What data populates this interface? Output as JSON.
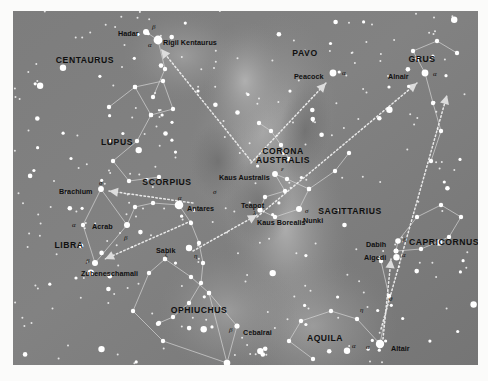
{
  "figure": {
    "kind": "star-chart",
    "frame": {
      "x": 13,
      "y": 11,
      "width": 465,
      "height": 354
    },
    "colors": {
      "sky_base": "#7b7b7b",
      "sky_light": "#9a9a9a",
      "milky_way": "#a8a8a8",
      "star": "#ffffff",
      "line": "#cfcfcf",
      "pointer": "#e6e6e6",
      "label": "#0f0f0f",
      "page": "#fbfbfa"
    }
  },
  "chart_data": {
    "type": "scatter",
    "xlabel": "",
    "ylabel": "",
    "constellations": [
      {
        "name": "CENTAURUS",
        "x": 72,
        "y": 45,
        "two_line": false
      },
      {
        "name": "LUPUS",
        "x": 104,
        "y": 127,
        "two_line": false
      },
      {
        "name": "SCORPIUS",
        "x": 154,
        "y": 167,
        "two_line": false
      },
      {
        "name": "LIBRA",
        "x": 56,
        "y": 230,
        "two_line": false
      },
      {
        "name": "OPHIUCHUS",
        "x": 186,
        "y": 295,
        "two_line": false
      },
      {
        "name": "CORONA AUSTRALIS",
        "x": 270,
        "y": 136,
        "two_line": true,
        "line1": "CORONA",
        "line2": "AUSTRALIS"
      },
      {
        "name": "SAGITTARIUS",
        "x": 337,
        "y": 196,
        "two_line": false
      },
      {
        "name": "PAVO",
        "x": 292,
        "y": 38,
        "two_line": false
      },
      {
        "name": "GRUS",
        "x": 409,
        "y": 44,
        "two_line": false
      },
      {
        "name": "CAPRICORNUS",
        "x": 431,
        "y": 227,
        "two_line": false
      },
      {
        "name": "AQUILA",
        "x": 312,
        "y": 323,
        "two_line": false
      }
    ],
    "named_stars": [
      {
        "name": "Hadar",
        "greek": "β",
        "label_x": 105,
        "label_y": 19,
        "greek_x": 139,
        "greek_y": 13,
        "sx": 133,
        "sy": 21,
        "r": 3.0
      },
      {
        "name": "Rigil Kentaurus",
        "greek": "α",
        "label_x": 150,
        "label_y": 28,
        "greek_x": 135,
        "greek_y": 31,
        "sx": 145,
        "sy": 29,
        "r": 4.4
      },
      {
        "name": "Brachium",
        "greek": "σ",
        "label_x": 46,
        "label_y": 177,
        "greek_x": 86,
        "greek_y": 169,
        "sx": 88,
        "sy": 178,
        "r": 2.9
      },
      {
        "name": "Antares",
        "greek": "α",
        "label_x": 174,
        "label_y": 194,
        "greek_x": 165,
        "greek_y": 184,
        "sx": 166,
        "sy": 194,
        "r": 4.3
      },
      {
        "name": "Acrab",
        "greek": "β",
        "label_x": 79,
        "label_y": 212,
        "greek_x": 111,
        "greek_y": 224,
        "sx": 114,
        "sy": 214,
        "r": 3.0
      },
      {
        "name": "Zubeneschamali",
        "greek": "β",
        "label_x": 68,
        "label_y": 259,
        "greek_x": 73,
        "greek_y": 247,
        "sx": 82,
        "sy": 252,
        "r": 3.0
      },
      {
        "name": "Sabik",
        "greek": "η",
        "label_x": 143,
        "label_y": 236,
        "greek_x": 181,
        "greek_y": 242,
        "sx": 176,
        "sy": 237,
        "r": 3.2
      },
      {
        "name": "Cebalrai",
        "greek": "β",
        "label_x": 230,
        "label_y": 318,
        "greek_x": 216,
        "greek_y": 316,
        "sx": 224,
        "sy": 315,
        "r": 2.6
      },
      {
        "name": "Rasalhague",
        "greek": "α",
        "label_x": 221,
        "label_y": 353,
        "greek_x": 205,
        "greek_y": 352,
        "sx": 214,
        "sy": 352,
        "r": 3.3
      },
      {
        "name": "Kaus Australis",
        "greek": "ε",
        "label_x": 206,
        "label_y": 163,
        "greek_x": 268,
        "greek_y": 155,
        "sx": 262,
        "sy": 163,
        "r": 2.9
      },
      {
        "name": "Teapot",
        "greek": "",
        "label_x": 228,
        "label_y": 191,
        "greek_x": 0,
        "greek_y": 0,
        "sx": 0,
        "sy": 0,
        "r": 0
      },
      {
        "name": "Kaus Borealis",
        "greek": "λ",
        "label_x": 244,
        "label_y": 208,
        "greek_x": 240,
        "greek_y": 199,
        "sx": 247,
        "sy": 199,
        "r": 2.6
      },
      {
        "name": "Nunki",
        "greek": "σ",
        "label_x": 290,
        "label_y": 206,
        "greek_x": 292,
        "greek_y": 197,
        "sx": 286,
        "sy": 198,
        "r": 3.0
      },
      {
        "name": "Peacock",
        "greek": "α",
        "label_x": 281,
        "label_y": 62,
        "greek_x": 329,
        "greek_y": 59,
        "sx": 320,
        "sy": 62,
        "r": 3.4
      },
      {
        "name": "Alnair",
        "greek": "α",
        "label_x": 375,
        "label_y": 62,
        "greek_x": 420,
        "greek_y": 60,
        "sx": 412,
        "sy": 62,
        "r": 3.4
      },
      {
        "name": "Dabih",
        "greek": "β",
        "label_x": 353,
        "label_y": 230,
        "greek_x": 390,
        "greek_y": 226,
        "sx": 385,
        "sy": 230,
        "r": 2.8
      },
      {
        "name": "Algedi",
        "greek": "α",
        "label_x": 351,
        "label_y": 243,
        "greek_x": 389,
        "greek_y": 241,
        "sx": 383,
        "sy": 240,
        "r": 2.5
      },
      {
        "name": "Altair",
        "greek": "α",
        "label_x": 378,
        "label_y": 334,
        "greek_x": 353,
        "greek_y": 333,
        "sx": 367,
        "sy": 333,
        "r": 4.2
      }
    ],
    "greek_only_labels": [
      {
        "glyph": "α",
        "x": 59,
        "y": 211
      },
      {
        "glyph": "σ",
        "x": 200,
        "y": 178
      },
      {
        "glyph": "ζ",
        "x": 152,
        "y": 240
      },
      {
        "glyph": "η",
        "x": 347,
        "y": 296
      },
      {
        "glyph": "θ",
        "x": 376,
        "y": 285
      },
      {
        "glyph": "α",
        "x": 339,
        "y": 332
      }
    ],
    "pointer_arrows": [
      {
        "from_x": 238,
        "from_y": 150,
        "to_x": 148,
        "to_y": 38,
        "note": "to Rigil Kentaurus"
      },
      {
        "from_x": 238,
        "from_y": 152,
        "to_x": 313,
        "to_y": 72,
        "note": "to Peacock"
      },
      {
        "from_x": 244,
        "from_y": 206,
        "to_x": 404,
        "to_y": 72,
        "note": "to Alnair"
      },
      {
        "from_x": 368,
        "from_y": 318,
        "to_x": 434,
        "to_y": 84,
        "note": "to Grus tail"
      },
      {
        "from_x": 180,
        "from_y": 192,
        "to_x": 96,
        "to_y": 180,
        "note": "to Brachium"
      },
      {
        "from_x": 178,
        "from_y": 210,
        "to_x": 92,
        "to_y": 248,
        "note": "to Zubeneschamali"
      },
      {
        "from_x": 180,
        "from_y": 240,
        "to_x": 244,
        "to_y": 204,
        "note": "to Kaus Borealis"
      },
      {
        "from_x": 370,
        "from_y": 328,
        "to_x": 378,
        "to_y": 248,
        "note": "to Algedi"
      }
    ],
    "constellation_lines": [
      {
        "name": "lupus",
        "points": [
          [
            96,
            96
          ],
          [
            122,
            76
          ],
          [
            138,
            104
          ],
          [
            124,
            130
          ],
          [
            100,
            150
          ],
          [
            116,
            170
          ],
          [
            146,
            166
          ]
        ]
      },
      {
        "name": "lupus-b",
        "points": [
          [
            122,
            76
          ],
          [
            150,
            70
          ],
          [
            160,
            98
          ],
          [
            138,
            104
          ]
        ]
      },
      {
        "name": "scorpius-head",
        "points": [
          [
            114,
            214
          ],
          [
            122,
            196
          ],
          [
            140,
            192
          ],
          [
            166,
            194
          ]
        ]
      },
      {
        "name": "scorpius-body",
        "points": [
          [
            166,
            194
          ],
          [
            178,
            212
          ],
          [
            186,
            232
          ],
          [
            190,
            252
          ],
          [
            188,
            272
          ],
          [
            176,
            292
          ],
          [
            160,
            306
          ],
          [
            146,
            312
          ]
        ]
      },
      {
        "name": "libra",
        "points": [
          [
            88,
            178
          ],
          [
            70,
            214
          ],
          [
            82,
            252
          ],
          [
            114,
            214
          ],
          [
            88,
            178
          ]
        ]
      },
      {
        "name": "ophiuchus",
        "points": [
          [
            152,
            248
          ],
          [
            178,
            266
          ],
          [
            196,
            282
          ],
          [
            214,
            352
          ],
          [
            150,
            330
          ],
          [
            120,
            300
          ],
          [
            136,
            262
          ],
          [
            152,
            248
          ]
        ]
      },
      {
        "name": "ophiuchus-b",
        "points": [
          [
            196,
            282
          ],
          [
            224,
            315
          ],
          [
            214,
            352
          ]
        ]
      },
      {
        "name": "sagittarius",
        "points": [
          [
            262,
            163
          ],
          [
            272,
            180
          ],
          [
            252,
            186
          ],
          [
            247,
            199
          ],
          [
            262,
            206
          ],
          [
            286,
            198
          ],
          [
            296,
            178
          ],
          [
            274,
            168
          ],
          [
            262,
            163
          ]
        ]
      },
      {
        "name": "sagittarius-b",
        "points": [
          [
            296,
            178
          ],
          [
            322,
            160
          ],
          [
            336,
            142
          ]
        ]
      },
      {
        "name": "corona-aus",
        "points": [
          [
            246,
            112
          ],
          [
            258,
            120
          ],
          [
            268,
            134
          ],
          [
            276,
            148
          ]
        ]
      },
      {
        "name": "grus",
        "points": [
          [
            412,
            62
          ],
          [
            400,
            40
          ],
          [
            424,
            30
          ],
          [
            444,
            42
          ]
        ]
      },
      {
        "name": "grus-b",
        "points": [
          [
            412,
            62
          ],
          [
            420,
            92
          ],
          [
            428,
            120
          ],
          [
            418,
            150
          ]
        ]
      },
      {
        "name": "capricornus",
        "points": [
          [
            383,
            240
          ],
          [
            385,
            230
          ],
          [
            404,
            206
          ],
          [
            428,
            194
          ],
          [
            448,
            206
          ],
          [
            436,
            226
          ],
          [
            408,
            238
          ],
          [
            383,
            240
          ]
        ]
      },
      {
        "name": "aquila",
        "points": [
          [
            367,
            333
          ],
          [
            344,
            308
          ],
          [
            318,
            300
          ],
          [
            288,
            310
          ],
          [
            276,
            330
          ],
          [
            300,
            348
          ]
        ]
      },
      {
        "name": "aquila-b",
        "points": [
          [
            367,
            333
          ],
          [
            376,
            285
          ],
          [
            368,
            250
          ]
        ]
      },
      {
        "name": "centaurus",
        "points": [
          [
            133,
            21
          ],
          [
            145,
            29
          ],
          [
            152,
            58
          ],
          [
            140,
            86
          ]
        ]
      }
    ]
  }
}
